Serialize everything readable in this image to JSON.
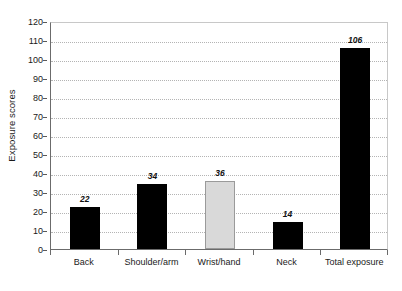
{
  "chart_data": {
    "type": "bar",
    "title": "",
    "subtitle": "",
    "xlabel": "",
    "ylabel": "Exposure scores",
    "categories": [
      "Back",
      "Shoulder/arm",
      "Wrist/hand",
      "Neck",
      "Total exposure"
    ],
    "values": [
      22,
      34,
      36,
      14,
      106
    ],
    "value_labels": [
      "22",
      "34",
      "36",
      "14",
      "106"
    ],
    "bar_colors": [
      "#000000",
      "#000000",
      "#d9d9d9",
      "#000000",
      "#000000"
    ],
    "ylim": [
      0,
      120
    ],
    "ytick_step": 10,
    "ytick_labels": [
      "0",
      "10",
      "20",
      "30",
      "40",
      "50",
      "60",
      "70",
      "80",
      "90",
      "100",
      "110",
      "120"
    ],
    "grid": true,
    "grid_axis": "y",
    "grid_style": "dotted",
    "grid_color": "#b4b4b4",
    "legend": false,
    "legend_position": "none",
    "plot_background": "#ffffff",
    "axis_color": "#6b6b6b",
    "frame_color": "#c8c8c8",
    "label_style": "bold-italic"
  },
  "axes": {
    "y_title": "Exposure scores"
  }
}
